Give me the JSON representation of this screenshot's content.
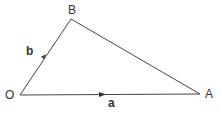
{
  "diagram": {
    "type": "vector-triangle",
    "points": {
      "O": {
        "x": 20,
        "y": 95
      },
      "B": {
        "x": 71,
        "y": 19
      },
      "A": {
        "x": 200,
        "y": 94
      }
    },
    "labels": {
      "O": "O",
      "B": "B",
      "A": "A",
      "vec_b": "b",
      "vec_a": "a"
    },
    "edges": [
      {
        "from": "O",
        "to": "B",
        "arrow": true,
        "label": "b"
      },
      {
        "from": "O",
        "to": "A",
        "arrow": true,
        "label": "a"
      },
      {
        "from": "B",
        "to": "A",
        "arrow": false
      }
    ],
    "stroke_color": "#444444"
  }
}
